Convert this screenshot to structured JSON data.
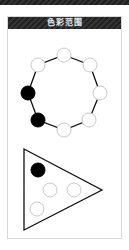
{
  "panel": {
    "title": "色彩范围"
  },
  "colors": {
    "filled": "#000000",
    "empty": "#ffffff",
    "empty_stroke": "#c8c8c8",
    "line": "#111111",
    "header_bg": "#2b2b2b"
  },
  "ring": {
    "nodes": [
      {
        "position": "top",
        "state": "empty"
      },
      {
        "position": "top-right",
        "state": "empty"
      },
      {
        "position": "right",
        "state": "empty"
      },
      {
        "position": "bottom-right",
        "state": "empty"
      },
      {
        "position": "bottom",
        "state": "empty"
      },
      {
        "position": "bottom-left",
        "state": "filled"
      },
      {
        "position": "left",
        "state": "filled"
      },
      {
        "position": "top-left",
        "state": "empty"
      }
    ]
  },
  "triangle": {
    "nodes": [
      {
        "position": "top",
        "state": "filled"
      },
      {
        "position": "middle-left",
        "state": "empty"
      },
      {
        "position": "middle-right",
        "state": "empty"
      },
      {
        "position": "bottom-left",
        "state": "empty"
      }
    ]
  }
}
